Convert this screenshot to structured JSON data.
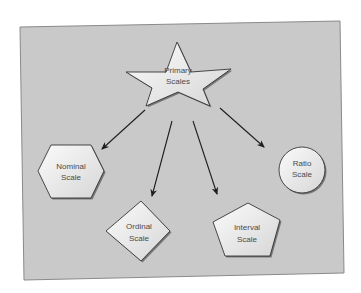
{
  "diagram": {
    "root": {
      "line1": "Primary",
      "line2": "Scales",
      "shape": "star"
    },
    "children": [
      {
        "id": "nominal",
        "line1": "Nominal",
        "line2": "Scale",
        "shape": "hexagon"
      },
      {
        "id": "ordinal",
        "line1": "Ordinal",
        "line2": "Scale",
        "shape": "diamond"
      },
      {
        "id": "interval",
        "line1": "Interval",
        "line2": "Scale",
        "shape": "pentagon"
      },
      {
        "id": "ratio",
        "line1": "Ratio",
        "line2": "Scale",
        "shape": "circle"
      }
    ],
    "colors": {
      "background": "#c9c9c9",
      "shape_fill": "#eeeeee",
      "outline": "#222222",
      "arrow": "#1e1e1e"
    }
  }
}
